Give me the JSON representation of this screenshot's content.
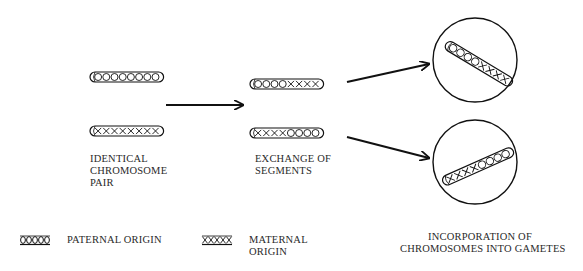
{
  "diagram": {
    "type": "process-flow",
    "stages": [
      {
        "id": "identical-pair",
        "label_lines": [
          "IDENTICAL",
          "CHROMOSOME",
          "PAIR"
        ],
        "chromosomes": [
          {
            "segments": "OOOOOOOO",
            "origin": "paternal"
          },
          {
            "segments": "XXXXXXXX",
            "origin": "maternal"
          }
        ]
      },
      {
        "id": "exchange",
        "label_lines": [
          "EXCHANGE OF",
          "SEGMENTS"
        ],
        "chromosomes": [
          {
            "segments": "OOOOXXXX",
            "origin": "recombinant"
          },
          {
            "segments": "XXXXOOOO",
            "origin": "recombinant"
          }
        ]
      },
      {
        "id": "gametes",
        "label_lines": [
          "INCORPORATION OF",
          "CHROMOSOMES INTO GAMETES"
        ],
        "gametes": [
          {
            "segments": "OOOOXXXX"
          },
          {
            "segments": "XXXXOOOO"
          }
        ]
      }
    ],
    "arrows": [
      {
        "from": "identical-pair",
        "to": "exchange"
      },
      {
        "from": "exchange",
        "to": "gamete-1"
      },
      {
        "from": "exchange",
        "to": "gamete-2"
      }
    ],
    "legend": [
      {
        "symbol": "OOOOO",
        "label_lines": [
          "PATERNAL ORIGIN"
        ]
      },
      {
        "symbol": "XXXXX",
        "label_lines": [
          "MATERNAL",
          "ORIGIN"
        ]
      }
    ],
    "colors": {
      "stroke": "#111111",
      "text": "#2a2a2a",
      "background": "#ffffff"
    }
  }
}
